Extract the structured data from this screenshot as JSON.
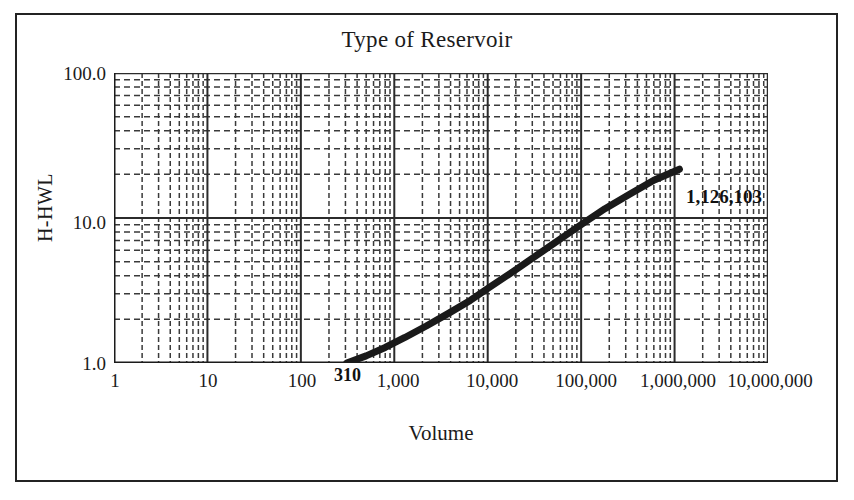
{
  "chart_data": {
    "type": "line",
    "title": "Type of Reservoir",
    "xlabel": "Volume",
    "ylabel": "H-HWL",
    "xscale": "log",
    "yscale": "log",
    "xlim": [
      1,
      10000000
    ],
    "ylim": [
      1,
      100
    ],
    "grid": "major and minor log gridlines on both axes",
    "legend": "none",
    "x_tick_labels": [
      "1",
      "10",
      "100",
      "1,000",
      "10,000",
      "100,000",
      "1,000,000",
      "10,000,000"
    ],
    "x_tick_values": [
      1,
      10,
      100,
      1000,
      10000,
      100000,
      1000000,
      10000000
    ],
    "y_tick_labels": [
      "100.0",
      "10.0",
      "1.0"
    ],
    "y_tick_values": [
      100,
      10,
      1
    ],
    "series": [
      {
        "name": "H-HWL vs Volume",
        "x": [
          310,
          500,
          800,
          1300,
          2200,
          3800,
          6500,
          11000,
          19000,
          33000,
          57000,
          100000,
          180000,
          330000,
          600000,
          1126103
        ],
        "y": [
          1.0,
          1.12,
          1.28,
          1.5,
          1.8,
          2.2,
          2.7,
          3.4,
          4.3,
          5.5,
          7.0,
          9.0,
          11.6,
          14.6,
          18.2,
          21.7
        ]
      }
    ],
    "annotations": [
      {
        "name": "start-point",
        "text": "310",
        "x": 310,
        "y": 1.0
      },
      {
        "name": "end-point",
        "text": "1,126,103",
        "x": 1126103,
        "y": 21.7
      }
    ]
  },
  "chart": {
    "title": "Type of Reservoir",
    "x_axis": {
      "title": "Volume",
      "ticks": [
        "1",
        "10",
        "100",
        "1,000",
        "10,000",
        "100,000",
        "1,000,000",
        "10,000,000"
      ]
    },
    "y_axis": {
      "title": "H-HWL",
      "ticks": [
        "100.0",
        "10.0",
        "1.0"
      ]
    },
    "annotations": {
      "start_label": "310",
      "end_label": "1,126,103"
    },
    "colors": {
      "line": "#1a1a1a",
      "grid_major": "#2b2b2b",
      "grid_minor": "#3a3a3a",
      "axis": "#1b1b1b",
      "frame": "#232323",
      "background": "#ffffff"
    }
  }
}
